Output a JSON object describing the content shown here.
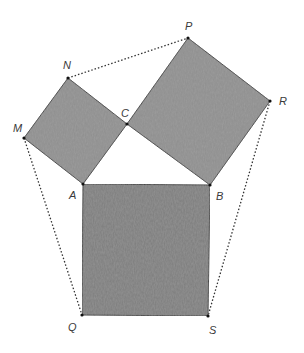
{
  "diagram": {
    "type": "geometry",
    "colors": {
      "square_fill": "#7d7d7d",
      "square_fill_light": "#8e8e8e",
      "stroke": "#333333",
      "background": "#ffffff"
    },
    "points": {
      "M": {
        "label": "M",
        "x": 24,
        "y": 138
      },
      "N": {
        "label": "N",
        "x": 68,
        "y": 78
      },
      "C": {
        "label": "C",
        "x": 127,
        "y": 124
      },
      "P": {
        "label": "P",
        "x": 188,
        "y": 38
      },
      "R": {
        "label": "R",
        "x": 270,
        "y": 101
      },
      "A": {
        "label": "A",
        "x": 83,
        "y": 184
      },
      "B": {
        "label": "B",
        "x": 210,
        "y": 185
      },
      "Q": {
        "label": "Q",
        "x": 82,
        "y": 315
      },
      "S": {
        "label": "S",
        "x": 208,
        "y": 316
      }
    },
    "squares": [
      {
        "name": "square-ACNM",
        "vertices": [
          "A",
          "C",
          "N",
          "M"
        ]
      },
      {
        "name": "square-CBRP",
        "vertices": [
          "C",
          "B",
          "R",
          "P"
        ]
      },
      {
        "name": "square-ABSQ",
        "vertices": [
          "A",
          "B",
          "S",
          "Q"
        ]
      }
    ],
    "dotted_segments": [
      [
        "N",
        "P"
      ],
      [
        "M",
        "Q"
      ],
      [
        "R",
        "S"
      ]
    ]
  }
}
